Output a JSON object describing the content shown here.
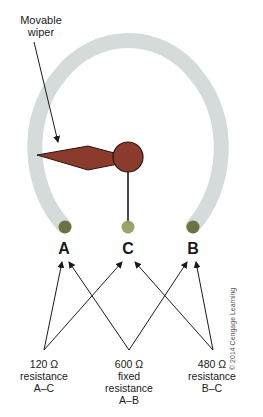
{
  "diagram": {
    "callout": {
      "line1": "Movable",
      "line2": "wiper"
    },
    "terminals": [
      {
        "id": "A",
        "label": "A"
      },
      {
        "id": "C",
        "label": "C"
      },
      {
        "id": "B",
        "label": "B"
      }
    ],
    "resistances": [
      {
        "value": "120 Ω",
        "line2": "resistance",
        "line3": "A–C",
        "line4": ""
      },
      {
        "value": "600 Ω",
        "line2": "fixed",
        "line3": "resistance",
        "line4": "A–B"
      },
      {
        "value": "480 Ω",
        "line2": "resistance",
        "line3": "B–C",
        "line4": ""
      }
    ],
    "copyright": "© 2014 Cengage Learning",
    "colors": {
      "track": "#d4dbda",
      "wiper": "#8b3b2b",
      "terminal": "#6e7242",
      "terminal_center": "#9ca266",
      "arrow": "#1a1a1a"
    }
  }
}
